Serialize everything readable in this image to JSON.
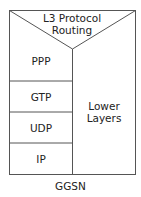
{
  "diagram": {
    "top_label_line1": "L3 Protocol",
    "top_label_line2": "Routing",
    "stack": [
      "PPP",
      "GTP",
      "UDP",
      "IP"
    ],
    "side_label_line1": "Lower",
    "side_label_line2": "Layers",
    "caption": "GGSN"
  }
}
